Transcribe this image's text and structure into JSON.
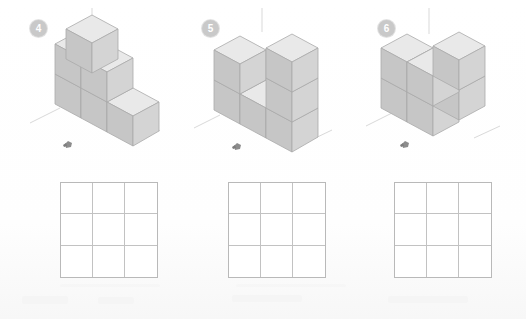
{
  "page": {
    "background_color": "#fdfdfd"
  },
  "style": {
    "badge_fill": "#c9c9c9",
    "badge_text_color": "#ffffff",
    "cube_top_color": "#e9e9e9",
    "cube_left_color": "#c6c6c6",
    "cube_right_color": "#d4d4d4",
    "cube_edge_color": "#a9a9a9",
    "axis_color": "#d6d6d6",
    "grid_border_color": "#b9b9b9",
    "grid_line_color": "#c2c2c2",
    "observer_color": "#8a8a8a"
  },
  "panels": [
    {
      "id": "panel-4",
      "badge_label": "4",
      "observer_icon": "observer-marker-icon",
      "figure_name": "isometric-cube-stack-4",
      "cubes_description": "Stepped pyramid: 3-cube L base row, middle layer two cubes, single top cube",
      "grid": {
        "name": "answer-grid-4",
        "rows": 3,
        "cols": 3,
        "cells": [
          "",
          "",
          "",
          "",
          "",
          "",
          "",
          "",
          ""
        ]
      }
    },
    {
      "id": "panel-5",
      "badge_label": "5",
      "observer_icon": "observer-marker-icon",
      "figure_name": "isometric-cube-stack-5",
      "cubes_description": "Flat wall, two deep at left, stepped notch centre, tall column right",
      "grid": {
        "name": "answer-grid-5",
        "rows": 3,
        "cols": 3,
        "cells": [
          "",
          "",
          "",
          "",
          "",
          "",
          "",
          "",
          ""
        ]
      }
    },
    {
      "id": "panel-6",
      "badge_label": "6",
      "observer_icon": "observer-marker-icon",
      "figure_name": "isometric-cube-stack-6",
      "cubes_description": "Solid block two wide two deep two tall with one notch at top front left",
      "grid": {
        "name": "answer-grid-6",
        "rows": 3,
        "cols": 3,
        "cells": [
          "",
          "",
          "",
          "",
          "",
          "",
          "",
          "",
          ""
        ]
      }
    }
  ]
}
